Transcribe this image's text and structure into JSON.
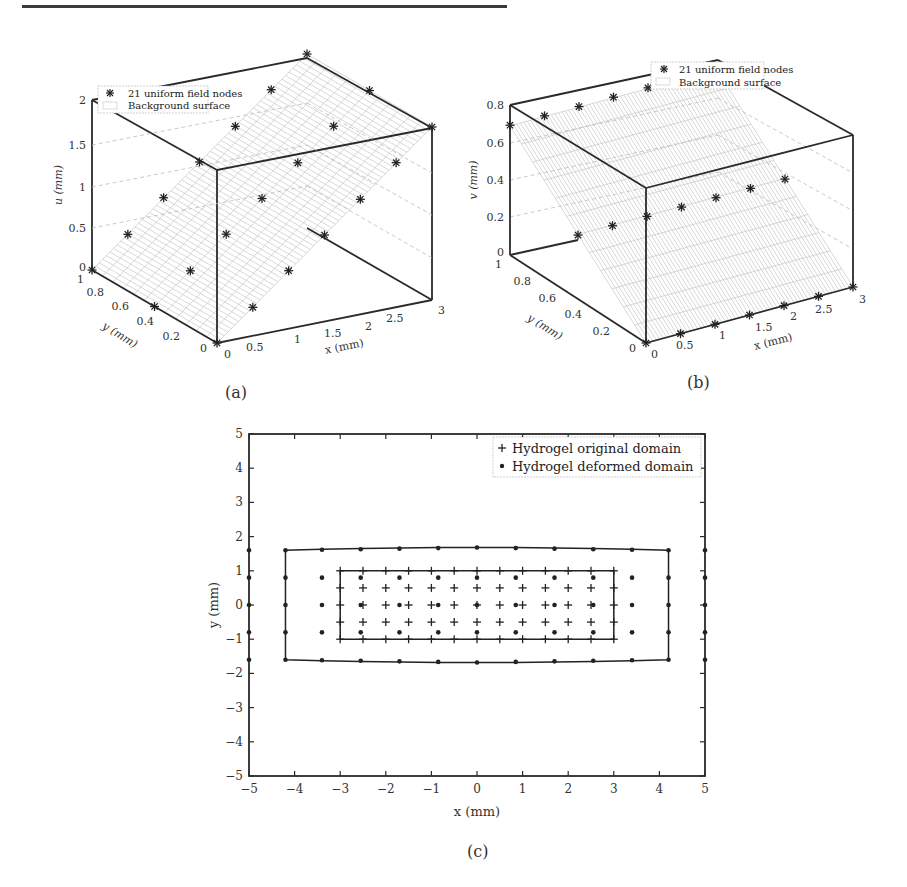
{
  "chart_data": [
    {
      "panel": "(a)",
      "type": "surface3d",
      "title": "",
      "xlabel": "x (mm)",
      "ylabel": "y (mm)",
      "zlabel": "u (mm)",
      "xlim": [
        0,
        3
      ],
      "ylim": [
        0,
        1
      ],
      "zlim": [
        0,
        2
      ],
      "xticks": [
        "0",
        "0.5",
        "1",
        "1.5",
        "2",
        "2.5",
        "3"
      ],
      "yticks": [
        "0",
        "0.2",
        "0.4",
        "0.6",
        "0.8",
        "1"
      ],
      "zticks": [
        "0",
        "0.5",
        "1",
        "1.5",
        "2"
      ],
      "legend": [
        "21 uniform field nodes",
        "Background surface"
      ],
      "legend_position": "upper left",
      "series": [
        {
          "name": "21 uniform field nodes",
          "marker": "asterisk",
          "points": [
            [
              0,
              0,
              0
            ],
            [
              0.5,
              0,
              0.33
            ],
            [
              1,
              0,
              0.67
            ],
            [
              1.5,
              0,
              1.0
            ],
            [
              2,
              0,
              1.33
            ],
            [
              2.5,
              0,
              1.67
            ],
            [
              3,
              0,
              2.0
            ],
            [
              0,
              0.5,
              0
            ],
            [
              0.5,
              0.5,
              0.33
            ],
            [
              1,
              0.5,
              0.67
            ],
            [
              1.5,
              0.5,
              1.0
            ],
            [
              2,
              0.5,
              1.33
            ],
            [
              2.5,
              0.5,
              1.67
            ],
            [
              3,
              0.5,
              2.0
            ],
            [
              0,
              1,
              0
            ],
            [
              0.5,
              1,
              0.33
            ],
            [
              1,
              1,
              0.67
            ],
            [
              1.5,
              1,
              1.0
            ],
            [
              2,
              1,
              1.33
            ],
            [
              2.5,
              1,
              1.67
            ],
            [
              3,
              1,
              2.0
            ]
          ]
        },
        {
          "name": "Background surface",
          "type": "mesh",
          "equation": "u = 2x/3"
        }
      ]
    },
    {
      "panel": "(b)",
      "type": "surface3d",
      "title": "",
      "xlabel": "x (mm)",
      "ylabel": "y (mm)",
      "zlabel": "v (mm)",
      "xlim": [
        0,
        3
      ],
      "ylim": [
        0,
        1
      ],
      "zlim": [
        0,
        0.8
      ],
      "xticks": [
        "0",
        "0.5",
        "1",
        "1.5",
        "2",
        "2.5",
        "3"
      ],
      "yticks": [
        "0",
        "0.2",
        "0.4",
        "0.6",
        "0.8",
        "1"
      ],
      "zticks": [
        "0",
        "0.2",
        "0.4",
        "0.6",
        "0.8"
      ],
      "legend": [
        "21 uniform field nodes",
        "Background surface"
      ],
      "legend_position": "upper right",
      "series": [
        {
          "name": "21 uniform field nodes",
          "marker": "asterisk",
          "points": [
            [
              0,
              0,
              0
            ],
            [
              0.5,
              0,
              0
            ],
            [
              1,
              0,
              0
            ],
            [
              1.5,
              0,
              0
            ],
            [
              2,
              0,
              0
            ],
            [
              2.5,
              0,
              0
            ],
            [
              3,
              0,
              0
            ],
            [
              0,
              0.5,
              0.33
            ],
            [
              0.5,
              0.5,
              0.33
            ],
            [
              1,
              0.5,
              0.33
            ],
            [
              1.5,
              0.5,
              0.33
            ],
            [
              2,
              0.5,
              0.33
            ],
            [
              2.5,
              0.5,
              0.33
            ],
            [
              3,
              0.5,
              0.33
            ],
            [
              0,
              1,
              0.67
            ],
            [
              0.5,
              1,
              0.67
            ],
            [
              1,
              1,
              0.67
            ],
            [
              1.5,
              1,
              0.67
            ],
            [
              2,
              1,
              0.67
            ],
            [
              2.5,
              1,
              0.67
            ],
            [
              3,
              1,
              0.67
            ]
          ]
        },
        {
          "name": "Background surface",
          "type": "mesh",
          "equation": "v = 2y/3"
        }
      ]
    },
    {
      "panel": "(c)",
      "type": "scatter",
      "title": "",
      "xlabel": "x (mm)",
      "ylabel": "y (mm)",
      "xlim": [
        -5,
        5
      ],
      "ylim": [
        -5,
        5
      ],
      "xticks": [
        "-5",
        "-4",
        "-3",
        "-2",
        "-1",
        "0",
        "1",
        "2",
        "3",
        "4",
        "5"
      ],
      "yticks": [
        "-5",
        "-4",
        "-3",
        "-2",
        "-1",
        "0",
        "1",
        "2",
        "3",
        "4",
        "5"
      ],
      "grid": false,
      "legend": [
        "Hydrogel original domain",
        "Hydrogel deformed domain"
      ],
      "legend_position": "upper right",
      "series": [
        {
          "name": "Hydrogel original domain",
          "marker": "plus",
          "x_grid": [
            -3,
            -2.5,
            -2,
            -1.5,
            -1,
            -0.5,
            0,
            0.5,
            1,
            1.5,
            2,
            2.5,
            3
          ],
          "y_grid": [
            -1,
            -0.5,
            0,
            0.5,
            1
          ],
          "boundary": [
            [
              -3,
              -1
            ],
            [
              3,
              -1
            ],
            [
              3,
              1
            ],
            [
              -3,
              1
            ]
          ]
        },
        {
          "name": "Hydrogel deformed domain",
          "marker": "dot",
          "x_grid": [
            -5,
            -4.2,
            -3.4,
            -2.55,
            -1.7,
            -0.85,
            0,
            0.85,
            1.7,
            2.55,
            3.4,
            4.2,
            5
          ],
          "y_grid_outer": [
            -1.6,
            -0.8,
            0,
            0.8,
            1.6
          ],
          "inner_points_y": [
            -0.8,
            0,
            0.8
          ],
          "boundary": [
            [
              -4.2,
              -1.6
            ],
            [
              -3.4,
              -1.63
            ],
            [
              -2.55,
              -1.65
            ],
            [
              -1.7,
              -1.67
            ],
            [
              -0.85,
              -1.68
            ],
            [
              0,
              -1.68
            ],
            [
              0.85,
              -1.68
            ],
            [
              1.7,
              -1.67
            ],
            [
              2.55,
              -1.65
            ],
            [
              3.4,
              -1.63
            ],
            [
              4.2,
              -1.6
            ],
            [
              4.2,
              1.6
            ],
            [
              3.4,
              1.63
            ],
            [
              2.55,
              1.65
            ],
            [
              1.7,
              1.67
            ],
            [
              0.85,
              1.68
            ],
            [
              0,
              1.68
            ],
            [
              -0.85,
              1.68
            ],
            [
              -1.7,
              1.67
            ],
            [
              -2.55,
              1.65
            ],
            [
              -3.4,
              1.63
            ],
            [
              -4.2,
              1.6
            ]
          ]
        }
      ]
    }
  ],
  "labels": {
    "a": "(a)",
    "b": "(b)",
    "c": "(c)"
  },
  "plot_a": {
    "zlabel": "u (mm)",
    "ylabel": "y (mm)",
    "xlabel": "x (mm)",
    "zticks": [
      "0",
      "0.5",
      "1",
      "1.5",
      "2"
    ],
    "yticks": [
      "0",
      "0.2",
      "0.4",
      "0.6",
      "0.8",
      "1"
    ],
    "xticks": [
      "0",
      "0.5",
      "1",
      "1.5",
      "2",
      "2.5",
      "3"
    ],
    "legend1": "21 uniform field nodes",
    "legend2": "Background surface"
  },
  "plot_b": {
    "zlabel": "v (mm)",
    "ylabel": "y (mm)",
    "xlabel": "x (mm)",
    "zticks": [
      "0",
      "0.2",
      "0.4",
      "0.6",
      "0.8"
    ],
    "yticks": [
      "0",
      "0.2",
      "0.4",
      "0.6",
      "0.8",
      "1"
    ],
    "xticks": [
      "0",
      "0.5",
      "1",
      "1.5",
      "2",
      "2.5",
      "3"
    ],
    "legend1": "21 uniform field nodes",
    "legend2": "Background surface"
  },
  "plot_c": {
    "xlabel": "x (mm)",
    "ylabel": "y (mm)",
    "xticks": [
      "−5",
      "−4",
      "−3",
      "−2",
      "−1",
      "0",
      "1",
      "2",
      "3",
      "4",
      "5"
    ],
    "yticks": [
      "5",
      "4",
      "3",
      "2",
      "1",
      "0",
      "−1",
      "−2",
      "−3",
      "−4",
      "−5"
    ],
    "legend1": "Hydrogel original domain",
    "legend2": "Hydrogel deformed domain"
  }
}
